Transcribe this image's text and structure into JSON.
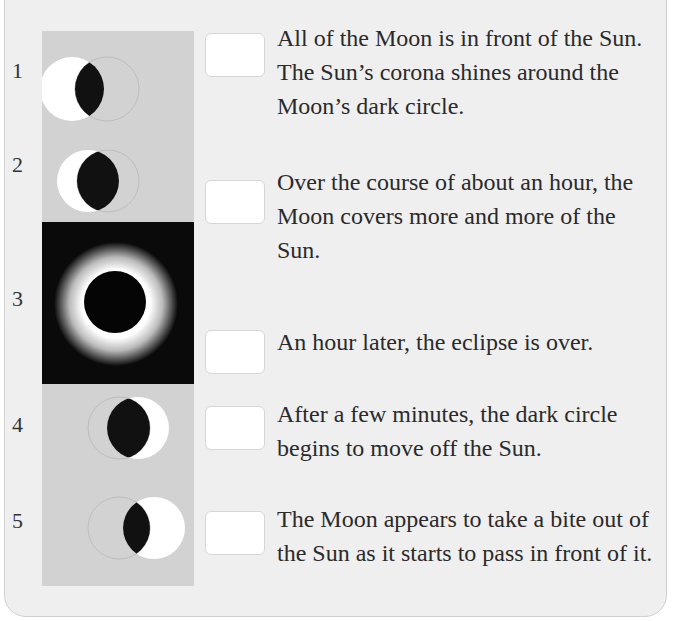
{
  "figure": {
    "images": [
      {
        "number": "1",
        "phase": "partial-beginning"
      },
      {
        "number": "2",
        "phase": "partial-increasing"
      },
      {
        "number": "3",
        "phase": "totality-corona"
      },
      {
        "number": "4",
        "phase": "partial-ending"
      },
      {
        "number": "5",
        "phase": "partial-final"
      }
    ]
  },
  "statements": [
    {
      "answer": "",
      "text": "All of the Moon is in front of the Sun. The Sun’s corona shines around the Moon’s dark circle."
    },
    {
      "answer": "",
      "text": "Over the course of about an hour, the Moon covers more and more of the Sun."
    },
    {
      "answer": "",
      "text": "An hour later, the eclipse is over."
    },
    {
      "answer": "",
      "text": "After a few minutes, the dark circle begins to move off the Sun."
    },
    {
      "answer": "",
      "text": "The Moon appears to take a bite out of the Sun as it starts to pass in front of it."
    }
  ],
  "colors": {
    "panel_bg": "#efefef",
    "strip_bg": "#d2d2d2",
    "moon_dark": "#111111",
    "sun": "#ffffff"
  }
}
